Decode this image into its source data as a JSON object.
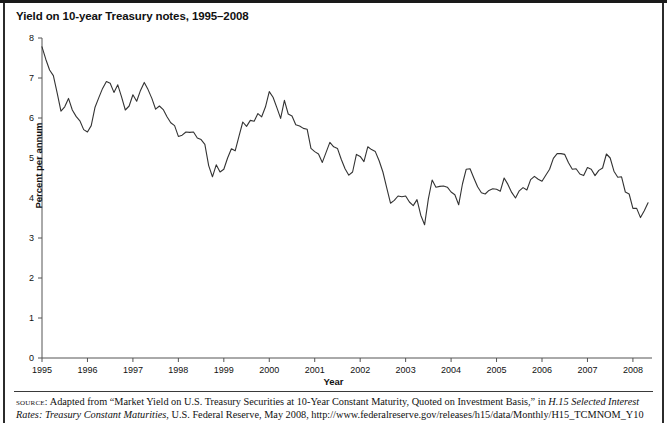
{
  "figure": {
    "title": "Yield on 10-year Treasury notes, 1995–2008",
    "source_label": "source:",
    "source_text_part1": " Adapted from “Market Yield on U.S. Treasury Securities at 10-Year Constant Maturity, Quoted on Investment Basis,” in ",
    "source_italic1": "H.15 Selected Interest Rates: Treasury Constant Maturities",
    "source_text_part2": ", U.S. Federal Reserve, May 2008, http://www.federalreserve.gov/releases/h15/data/Monthly/H15_TCMNOM_Y10"
  },
  "chart_data": {
    "type": "line",
    "title": "Yield on 10-year Treasury notes, 1995–2008",
    "xlabel": "Year",
    "ylabel": "Percent per annum",
    "xlim": [
      1995,
      2008.42
    ],
    "ylim": [
      0,
      8
    ],
    "ytick_values": [
      0,
      1,
      2,
      3,
      4,
      5,
      6,
      7,
      8
    ],
    "ytick_labels": [
      "0",
      "1",
      "2",
      "3",
      "4",
      "5",
      "6",
      "7",
      "8"
    ],
    "xtick_values": [
      1995,
      1996,
      1997,
      1998,
      1999,
      2000,
      2001,
      2002,
      2003,
      2004,
      2005,
      2006,
      2007,
      2008
    ],
    "xtick_labels": [
      "1995",
      "1996",
      "1997",
      "1998",
      "1999",
      "2000",
      "2001",
      "2002",
      "2003",
      "2004",
      "2005",
      "2006",
      "2007",
      "2008"
    ],
    "grid": false,
    "legend": false,
    "line_color": "#333333",
    "series": [
      {
        "name": "10-year Treasury constant maturity yield",
        "frequency": "monthly",
        "x": [
          1995.0,
          1995.083,
          1995.167,
          1995.25,
          1995.333,
          1995.417,
          1995.5,
          1995.583,
          1995.667,
          1995.75,
          1995.833,
          1995.917,
          1996.0,
          1996.083,
          1996.167,
          1996.25,
          1996.333,
          1996.417,
          1996.5,
          1996.583,
          1996.667,
          1996.75,
          1996.833,
          1996.917,
          1997.0,
          1997.083,
          1997.167,
          1997.25,
          1997.333,
          1997.417,
          1997.5,
          1997.583,
          1997.667,
          1997.75,
          1997.833,
          1997.917,
          1998.0,
          1998.083,
          1998.167,
          1998.25,
          1998.333,
          1998.417,
          1998.5,
          1998.583,
          1998.667,
          1998.75,
          1998.833,
          1998.917,
          1999.0,
          1999.083,
          1999.167,
          1999.25,
          1999.333,
          1999.417,
          1999.5,
          1999.583,
          1999.667,
          1999.75,
          1999.833,
          1999.917,
          2000.0,
          2000.083,
          2000.167,
          2000.25,
          2000.333,
          2000.417,
          2000.5,
          2000.583,
          2000.667,
          2000.75,
          2000.833,
          2000.917,
          2001.0,
          2001.083,
          2001.167,
          2001.25,
          2001.333,
          2001.417,
          2001.5,
          2001.583,
          2001.667,
          2001.75,
          2001.833,
          2001.917,
          2002.0,
          2002.083,
          2002.167,
          2002.25,
          2002.333,
          2002.417,
          2002.5,
          2002.583,
          2002.667,
          2002.75,
          2002.833,
          2002.917,
          2003.0,
          2003.083,
          2003.167,
          2003.25,
          2003.333,
          2003.417,
          2003.5,
          2003.583,
          2003.667,
          2003.75,
          2003.833,
          2003.917,
          2004.0,
          2004.083,
          2004.167,
          2004.25,
          2004.333,
          2004.417,
          2004.5,
          2004.583,
          2004.667,
          2004.75,
          2004.833,
          2004.917,
          2005.0,
          2005.083,
          2005.167,
          2005.25,
          2005.333,
          2005.417,
          2005.5,
          2005.583,
          2005.667,
          2005.75,
          2005.833,
          2005.917,
          2006.0,
          2006.083,
          2006.167,
          2006.25,
          2006.333,
          2006.417,
          2006.5,
          2006.583,
          2006.667,
          2006.75,
          2006.833,
          2006.917,
          2007.0,
          2007.083,
          2007.167,
          2007.25,
          2007.333,
          2007.417,
          2007.5,
          2007.583,
          2007.667,
          2007.75,
          2007.833,
          2007.917,
          2008.0,
          2008.083,
          2008.167,
          2008.25,
          2008.333
        ],
        "values": [
          7.78,
          7.47,
          7.2,
          7.06,
          6.63,
          6.17,
          6.28,
          6.49,
          6.2,
          6.04,
          5.93,
          5.71,
          5.65,
          5.81,
          6.27,
          6.51,
          6.74,
          6.91,
          6.87,
          6.64,
          6.83,
          6.53,
          6.2,
          6.3,
          6.58,
          6.42,
          6.69,
          6.89,
          6.71,
          6.49,
          6.22,
          6.3,
          6.21,
          6.03,
          5.88,
          5.81,
          5.54,
          5.57,
          5.65,
          5.64,
          5.65,
          5.5,
          5.46,
          5.34,
          4.81,
          4.53,
          4.83,
          4.65,
          4.72,
          5.0,
          5.23,
          5.18,
          5.54,
          5.9,
          5.79,
          5.94,
          5.92,
          6.11,
          6.03,
          6.28,
          6.66,
          6.52,
          6.26,
          5.99,
          6.44,
          6.1,
          6.05,
          5.83,
          5.8,
          5.74,
          5.72,
          5.24,
          5.16,
          5.1,
          4.89,
          5.14,
          5.39,
          5.28,
          5.24,
          4.97,
          4.73,
          4.57,
          4.65,
          5.09,
          5.04,
          4.91,
          5.28,
          5.21,
          5.16,
          4.93,
          4.65,
          4.26,
          3.87,
          3.94,
          4.05,
          4.03,
          4.05,
          3.9,
          3.81,
          3.96,
          3.57,
          3.33,
          3.98,
          4.45,
          4.27,
          4.29,
          4.3,
          4.27,
          4.15,
          4.08,
          3.83,
          4.35,
          4.72,
          4.73,
          4.5,
          4.28,
          4.13,
          4.1,
          4.19,
          4.23,
          4.22,
          4.17,
          4.5,
          4.34,
          4.14,
          4.0,
          4.18,
          4.26,
          4.2,
          4.46,
          4.54,
          4.47,
          4.42,
          4.57,
          4.72,
          4.99,
          5.11,
          5.11,
          5.09,
          4.88,
          4.72,
          4.73,
          4.6,
          4.56,
          4.76,
          4.72,
          4.56,
          4.69,
          4.75,
          5.1,
          5.0,
          4.67,
          4.52,
          4.53,
          4.15,
          4.1,
          3.74,
          3.74,
          3.51,
          3.68,
          3.88
        ]
      }
    ],
    "key_points": [
      {
        "label": "start",
        "x": 1995.0,
        "y": 7.78
      },
      {
        "label": "1996 low",
        "x": 1996.0,
        "y": 5.65
      },
      {
        "label": "1997 peak",
        "x": 1997.25,
        "y": 6.89
      },
      {
        "label": "1998 trough",
        "x": 1998.75,
        "y": 4.53
      },
      {
        "label": "2000 peak",
        "x": 2000.0,
        "y": 6.66
      },
      {
        "label": "2003 trough",
        "x": 2003.417,
        "y": 3.33
      },
      {
        "label": "2006 peak",
        "x": 2006.333,
        "y": 5.11
      },
      {
        "label": "end",
        "x": 2008.333,
        "y": 3.88
      }
    ]
  }
}
